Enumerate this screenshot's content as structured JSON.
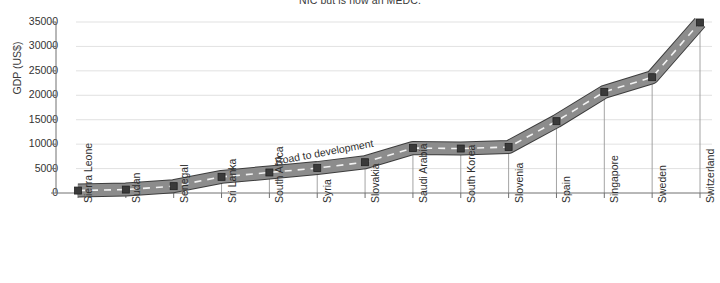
{
  "chart_data": {
    "type": "line",
    "title": "NIC but is now an MEDC.",
    "subtitle": "",
    "xlabel": "",
    "ylabel": "GDP (US$)",
    "ylim": [
      0,
      35000
    ],
    "yticks": [
      0,
      5000,
      10000,
      15000,
      20000,
      25000,
      30000,
      35000
    ],
    "ytick_labels": [
      "0",
      "5000",
      "10000",
      "15000",
      "20000",
      "25000",
      "30000",
      "35000"
    ],
    "grid": true,
    "legend": "none",
    "categories": [
      "Sierra Leone",
      "Sudan",
      "Senegal",
      "Sri Lanka",
      "South Africa",
      "Syria",
      "Slovakia",
      "Saudi Arabia",
      "South Korea",
      "Slovenia",
      "Spain",
      "Singapore",
      "Sweden",
      "Switzerland"
    ],
    "values": [
      500,
      700,
      1400,
      3300,
      4200,
      5100,
      6300,
      9200,
      9100,
      9400,
      14700,
      20700,
      23700,
      34900
    ],
    "series": [
      {
        "name": "GDP (US$)",
        "values": [
          500,
          700,
          1400,
          3300,
          4200,
          5100,
          6300,
          9200,
          9100,
          9400,
          14700,
          20700,
          23700,
          34900
        ]
      }
    ],
    "annotations": [
      {
        "text": "Road to development",
        "x_category": "Syria",
        "rotation": -10.5
      }
    ],
    "style": {
      "road_fill": "#8c8c8c",
      "road_edge": "#3d3d3d",
      "centerline": "#f2f2f2",
      "marker_fill": "#3a3a3a",
      "grid_color": "#d9d9d9",
      "axis_color": "#707070",
      "stem_color": "#9a9a9a",
      "text_color": "#2f2f2f",
      "background": "#ffffff"
    }
  }
}
